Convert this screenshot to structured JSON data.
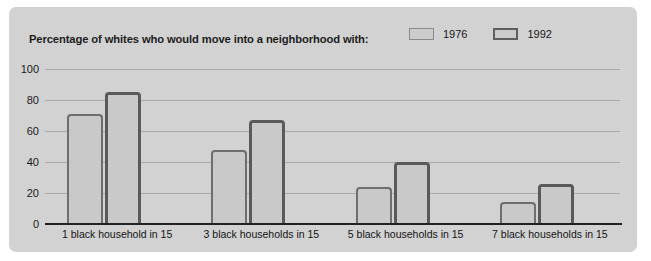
{
  "chart_data": {
    "type": "bar",
    "title": "Percentage of whites who would move into a neighborhood with:",
    "xlabel": "",
    "ylabel": "",
    "ylim": [
      0,
      100
    ],
    "yticks": [
      0,
      20,
      40,
      60,
      80,
      100
    ],
    "grid": true,
    "legend_position": "top-right",
    "categories": [
      "1 black household in 15",
      "3 black households in 15",
      "5 black households in 15",
      "7 black households in 15"
    ],
    "series": [
      {
        "name": "1976",
        "values": [
          71,
          48,
          24,
          14
        ],
        "color": "#c9c9c9",
        "border": "#6e6e6e"
      },
      {
        "name": "1992",
        "values": [
          85,
          67,
          40,
          26
        ],
        "color": "#c9c9c9",
        "border": "#5a5a5a"
      }
    ]
  },
  "figure": {
    "background": "#d2d2d2",
    "page_background": "#ffffff"
  }
}
